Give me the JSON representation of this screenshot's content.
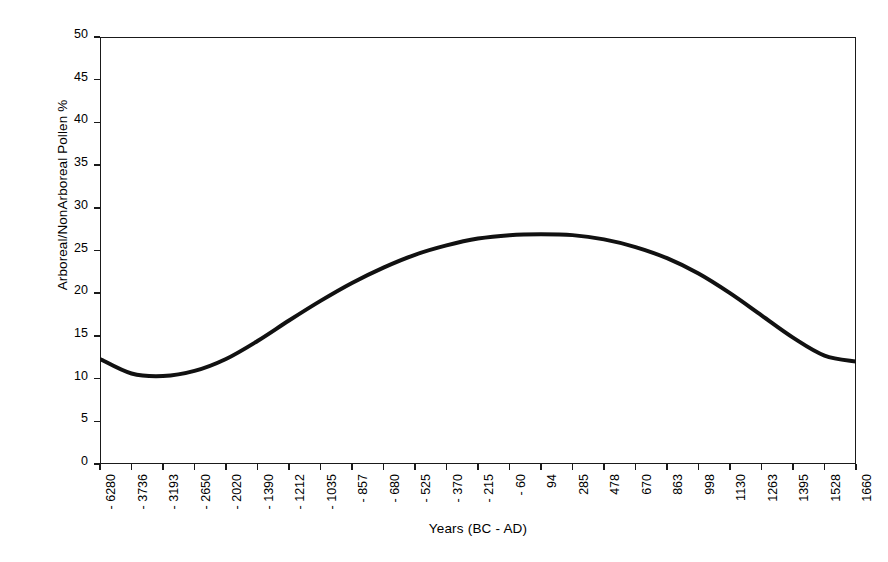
{
  "chart_data": {
    "type": "line",
    "title": "",
    "xlabel": "Years (BC - AD)",
    "ylabel": "Arboreal/NonArboreal Pollen %",
    "grid": false,
    "legend": false,
    "ylim": [
      0,
      50
    ],
    "ytick_values": [
      0,
      5,
      10,
      15,
      20,
      25,
      30,
      35,
      40,
      45,
      50
    ],
    "ytick_labels": [
      "0",
      "5",
      "10",
      "15",
      "20",
      "25",
      "30",
      "35",
      "40",
      "45",
      "50"
    ],
    "categories": [
      "- 6280",
      "- 3736",
      "- 3193",
      "- 2650",
      "- 2020",
      "- 1390",
      "- 1212",
      "- 1035",
      "- 857",
      "- 680",
      "- 525",
      "- 370",
      "- 215",
      "- 60",
      "94",
      "285",
      "478",
      "670",
      "863",
      "998",
      "1130",
      "1263",
      "1395",
      "1528",
      "1660"
    ],
    "series": [
      {
        "name": "Arboreal/NonArboreal Pollen %",
        "color": "#111111",
        "values": [
          12.3,
          10.6,
          10.3,
          10.9,
          12.3,
          14.4,
          16.8,
          19.1,
          21.2,
          23.0,
          24.5,
          25.6,
          26.4,
          26.8,
          26.9,
          26.8,
          26.3,
          25.4,
          24.1,
          22.3,
          20.0,
          17.4,
          14.8,
          12.7,
          12.0
        ]
      }
    ]
  },
  "axis": {
    "x_title": "Years (BC - AD)",
    "y_title": "Arboreal/NonArboreal Pollen %"
  }
}
